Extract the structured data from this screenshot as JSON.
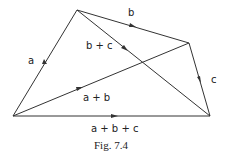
{
  "figure": {
    "caption": "Fig. 7.4",
    "points": {
      "O": [
        13,
        116
      ],
      "A": [
        77,
        10
      ],
      "B": [
        189,
        43
      ],
      "C": [
        210,
        116
      ]
    },
    "vectors": [
      {
        "name": "a",
        "from": "O",
        "to": "A",
        "label": "a"
      },
      {
        "name": "b",
        "from": "A",
        "to": "B",
        "label": "b"
      },
      {
        "name": "c",
        "from": "B",
        "to": "C",
        "label": "c"
      },
      {
        "name": "b+c",
        "from": "A",
        "to": "C",
        "label": "b+c"
      },
      {
        "name": "a+b",
        "from": "O",
        "to": "B",
        "label": "a+b"
      },
      {
        "name": "a+b+c",
        "from": "O",
        "to": "C",
        "label": "a + b + c"
      }
    ],
    "labels": {
      "a": "a",
      "b": "b",
      "c": "c",
      "bc": "b + c",
      "ab": "a + b",
      "abc": "a + b + c"
    }
  }
}
